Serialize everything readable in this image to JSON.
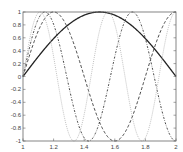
{
  "chart_data": {
    "type": "line",
    "title": "",
    "xlabel": "",
    "ylabel": "",
    "xlim": [
      1,
      2
    ],
    "ylim": [
      -1,
      1
    ],
    "grid": false,
    "legend": null,
    "x_ticks": [
      "1",
      "1.2",
      "1.4",
      "1.6",
      "1.8",
      "2"
    ],
    "y_ticks": [
      "-1",
      "-0.8",
      "-0.6",
      "-0.4",
      "-0.2",
      "0",
      "0.2",
      "0.4",
      "0.6",
      "0.8",
      "1"
    ],
    "series": [
      {
        "name": "solid",
        "style": "solid",
        "color": "#222222",
        "width": 1.3,
        "freq": 1.0
      },
      {
        "name": "dashed",
        "style": "dashed",
        "color": "#333333",
        "width": 0.9,
        "freq": 2.5
      },
      {
        "name": "dash-dot",
        "style": "dashdot",
        "color": "#333333",
        "width": 0.9,
        "freq": 3.5
      },
      {
        "name": "dotted-light",
        "style": "dotted",
        "color": "#bbbbbb",
        "width": 0.9,
        "freq": 4.5
      }
    ]
  }
}
